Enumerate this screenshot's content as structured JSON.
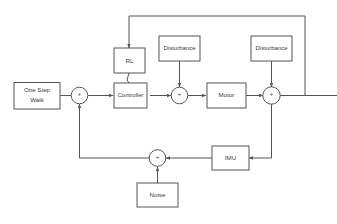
{
  "diagram": {
    "background_color": "#ffffff",
    "line_color": "#555555",
    "text_color": "#3a3a3a",
    "blocks": [
      {
        "id": "one-step-walk",
        "label_line1": "One Step",
        "label_line2": "Walk",
        "label": "One Step Walk"
      },
      {
        "id": "rl",
        "label": "RL"
      },
      {
        "id": "controller",
        "label": "Controller"
      },
      {
        "id": "disturbance-1",
        "label": "Disturbance"
      },
      {
        "id": "motor",
        "label": "Motor"
      },
      {
        "id": "disturbance-2",
        "label": "Disturbance"
      },
      {
        "id": "imu",
        "label": "IMU"
      },
      {
        "id": "noise",
        "label": "Noise"
      }
    ],
    "summing_junctions": [
      {
        "id": "sum-input",
        "sign": "+"
      },
      {
        "id": "sum-disturbance-1",
        "sign": "+"
      },
      {
        "id": "sum-disturbance-2",
        "sign": "+"
      },
      {
        "id": "sum-noise",
        "sign": "+"
      }
    ]
  }
}
